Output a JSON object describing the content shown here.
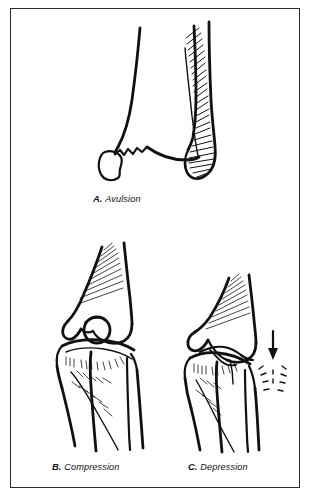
{
  "figure": {
    "kind": "anatomical-line-illustration",
    "background_color": "#ffffff",
    "ink_color": "#111111",
    "frame_color": "#2b2b2b",
    "panels": [
      {
        "id": "A",
        "letter": "A.",
        "label": "Avulsion",
        "subject": "distal tibia and fibula with avulsed bone fragment"
      },
      {
        "id": "B",
        "letter": "B.",
        "label": "Compression",
        "subject": "knee joint with compressed tibial plateau"
      },
      {
        "id": "C",
        "letter": "C.",
        "label": "Depression",
        "subject": "knee joint with depressed tibial plateau and impact arrow"
      }
    ]
  },
  "captions": {
    "a": {
      "letter": "A.",
      "text": "Avulsion"
    },
    "b": {
      "letter": "B.",
      "text": "Compression"
    },
    "c": {
      "letter": "C.",
      "text": "Depression"
    }
  }
}
